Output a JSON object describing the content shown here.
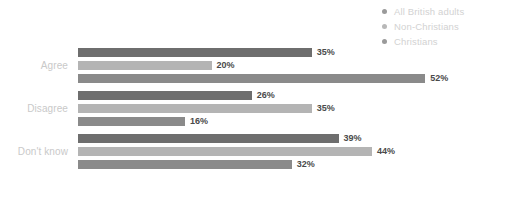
{
  "chart_data": {
    "type": "bar",
    "orientation": "horizontal",
    "title": "",
    "subtitle": "",
    "xlabel": "",
    "ylabel": "",
    "grid": false,
    "legend_position": "top-right",
    "value_suffix": "%",
    "xlim": [
      0,
      62
    ],
    "categories": [
      "Agree",
      "Disagree",
      "Don't know"
    ],
    "series": [
      {
        "name": "All British adults",
        "color": "#6e6e6e",
        "values": [
          35,
          26,
          39
        ],
        "labels": [
          "35%",
          "26%",
          "39%"
        ]
      },
      {
        "name": "Non-Christians",
        "color": "#b4b4b4",
        "values": [
          20,
          35,
          44
        ],
        "labels": [
          "20%",
          "35%",
          "44%"
        ]
      },
      {
        "name": "Christians",
        "color": "#8a8a8a",
        "values": [
          52,
          16,
          32
        ],
        "labels": [
          "52%",
          "16%",
          "32%"
        ]
      }
    ]
  },
  "legend": {
    "items": [
      {
        "label": "All British adults",
        "color": "#9a9a9a"
      },
      {
        "label": "Non-Christians",
        "color": "#b8b8b8"
      },
      {
        "label": "Christians",
        "color": "#9a9a9a"
      }
    ]
  },
  "axis": {
    "category_labels": [
      "Agree",
      "Disagree",
      "Don't know"
    ]
  },
  "groups": [
    {
      "label": "Agree",
      "bars": [
        {
          "series": "All British adults",
          "value": 35,
          "label": "35%",
          "color": "#6e6e6e"
        },
        {
          "series": "Non-Christians",
          "value": 20,
          "label": "20%",
          "color": "#b4b4b4"
        },
        {
          "series": "Christians",
          "value": 52,
          "label": "52%",
          "color": "#8a8a8a"
        }
      ]
    },
    {
      "label": "Disagree",
      "bars": [
        {
          "series": "All British adults",
          "value": 26,
          "label": "26%",
          "color": "#6e6e6e"
        },
        {
          "series": "Non-Christians",
          "value": 35,
          "label": "35%",
          "color": "#b4b4b4"
        },
        {
          "series": "Christians",
          "value": 16,
          "label": "16%",
          "color": "#8a8a8a"
        }
      ]
    },
    {
      "label": "Don't know",
      "bars": [
        {
          "series": "All British adults",
          "value": 39,
          "label": "39%",
          "color": "#6e6e6e"
        },
        {
          "series": "Non-Christians",
          "value": 44,
          "label": "44%",
          "color": "#b4b4b4"
        },
        {
          "series": "Christians",
          "value": 32,
          "label": "32%",
          "color": "#8a8a8a"
        }
      ]
    }
  ],
  "scale": {
    "px_per_percent": 6.68
  }
}
